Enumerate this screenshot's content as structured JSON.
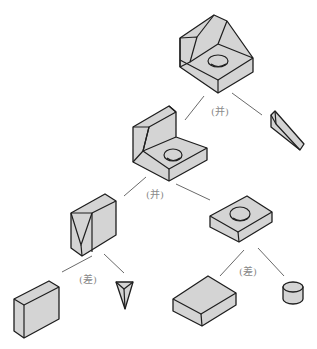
{
  "diagram": {
    "type": "CSG tree (constructive solid geometry)",
    "colors": {
      "fill": "#d4d4d4",
      "outline": "#1e1e1e",
      "connector": "#6a6a6a",
      "label": "#8a8a8a"
    },
    "operations": [
      {
        "id": "op-root",
        "label": "(并)",
        "meaning": "union",
        "x": 218,
        "y": 100
      },
      {
        "id": "op-mid",
        "label": "(并)",
        "meaning": "union",
        "x": 152,
        "y": 186
      },
      {
        "id": "op-left",
        "label": "(差)",
        "meaning": "difference",
        "x": 84,
        "y": 270
      },
      {
        "id": "op-right",
        "label": "(差)",
        "meaning": "difference",
        "x": 240,
        "y": 262
      }
    ],
    "nodes": [
      {
        "id": "final-part",
        "desc": "Final composite part with hole and triangular rib"
      },
      {
        "id": "wedge",
        "desc": "Sloped wedge"
      },
      {
        "id": "l-bracket",
        "desc": "L-bracket with hole and triangular cut"
      },
      {
        "id": "block-with-notch",
        "desc": "Upright block with V-notch"
      },
      {
        "id": "plate-with-hole",
        "desc": "Plate with hole"
      },
      {
        "id": "plain-block",
        "desc": "Upright plain block"
      },
      {
        "id": "triangular-prism",
        "desc": "Inverted triangular prism"
      },
      {
        "id": "plain-plate",
        "desc": "Plain plate"
      },
      {
        "id": "cylinder",
        "desc": "Short cylinder"
      }
    ]
  }
}
